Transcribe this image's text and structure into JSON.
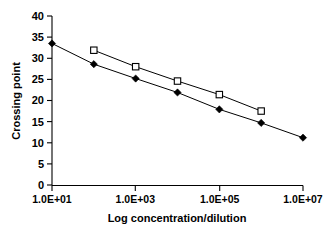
{
  "chart_data": {
    "type": "line",
    "title": "",
    "xlabel": "Log concentration/dilution",
    "ylabel": "Crossing point",
    "xscale": "log",
    "xlim": [
      10,
      10000000
    ],
    "ylim": [
      0,
      40
    ],
    "grid": false,
    "legend": "none",
    "x_tick_labels": [
      "1.0E+01",
      "1.0E+03",
      "1.0E+05",
      "1.0E+07"
    ],
    "x_tick_values": [
      10,
      1000,
      100000,
      10000000
    ],
    "y_tick_labels": [
      "0",
      "5",
      "10",
      "15",
      "20",
      "25",
      "30",
      "35",
      "40"
    ],
    "y_tick_values": [
      0,
      5,
      10,
      15,
      20,
      25,
      30,
      35,
      40
    ],
    "series": [
      {
        "name": "filled-diamond-series",
        "marker": "filled-diamond",
        "x": [
          10,
          100,
          1000,
          10000,
          100000,
          1000000,
          10000000
        ],
        "values": [
          33.5,
          28.6,
          25.2,
          21.9,
          17.9,
          14.7,
          11.2
        ]
      },
      {
        "name": "open-square-series",
        "marker": "open-square",
        "x": [
          100,
          1000,
          10000,
          100000,
          1000000
        ],
        "values": [
          31.9,
          28.0,
          24.6,
          21.4,
          17.5
        ]
      }
    ]
  },
  "axes": {
    "y_title": "Crossing point",
    "x_title": "Log concentration/dilution"
  }
}
